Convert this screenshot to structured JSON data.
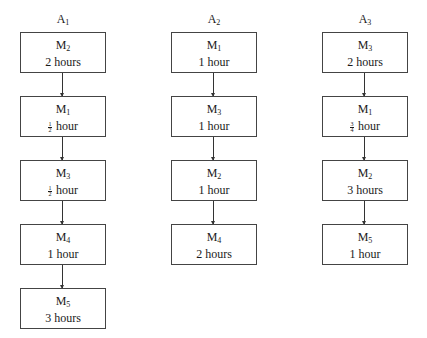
{
  "diagram": {
    "type": "flowchart",
    "columns": [
      {
        "id": "A1",
        "title_main": "A",
        "title_sub": "1",
        "steps": [
          {
            "machine": "M",
            "machine_sub": "2",
            "duration": "2 hours"
          },
          {
            "machine": "M",
            "machine_sub": "1",
            "duration_frac_num": "1",
            "duration_frac_den": "2",
            "duration": "hour"
          },
          {
            "machine": "M",
            "machine_sub": "3",
            "duration_frac_num": "1",
            "duration_frac_den": "2",
            "duration": "hour"
          },
          {
            "machine": "M",
            "machine_sub": "4",
            "duration": "1 hour"
          },
          {
            "machine": "M",
            "machine_sub": "5",
            "duration": "3 hours"
          }
        ]
      },
      {
        "id": "A2",
        "title_main": "A",
        "title_sub": "2",
        "steps": [
          {
            "machine": "M",
            "machine_sub": "1",
            "duration": "1 hour"
          },
          {
            "machine": "M",
            "machine_sub": "3",
            "duration": "1 hour"
          },
          {
            "machine": "M",
            "machine_sub": "2",
            "duration": "1 hour"
          },
          {
            "machine": "M",
            "machine_sub": "4",
            "duration": "2 hours"
          }
        ]
      },
      {
        "id": "A3",
        "title_main": "A",
        "title_sub": "3",
        "steps": [
          {
            "machine": "M",
            "machine_sub": "3",
            "duration": "2 hours"
          },
          {
            "machine": "M",
            "machine_sub": "1",
            "duration_frac_num": "3",
            "duration_frac_den": "4",
            "duration": "hour"
          },
          {
            "machine": "M",
            "machine_sub": "2",
            "duration": "3 hours"
          },
          {
            "machine": "M",
            "machine_sub": "5",
            "duration": "1 hour"
          }
        ]
      }
    ],
    "colors": {
      "border": "#444444",
      "text": "#1a1a1a",
      "background": "#ffffff"
    }
  }
}
